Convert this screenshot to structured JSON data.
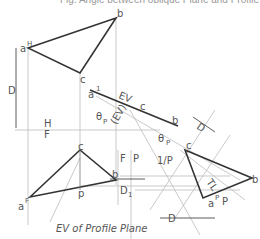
{
  "caption": "Fig. Angle between oblique Plane and Profile",
  "labels": {
    "aH": "a",
    "aH_sup": "H",
    "b_top": "b",
    "c_top": "c",
    "D_left": "D",
    "H": "H",
    "F": "F",
    "c_front": "c",
    "b_front": "b",
    "aF": "a",
    "aF_sup": "F",
    "p": "p",
    "FP_F": "F",
    "FP_P": "P",
    "D1": "D",
    "D1_sub": "1",
    "a1": "a",
    "a1_sup": "1",
    "EV": "EV",
    "c_aux": "c",
    "b_aux": "b",
    "EV_paren": "(EV)",
    "theta1": "θ",
    "theta1_sub": "P",
    "theta2": "θ",
    "theta2_sub": "P",
    "D_aux": "D",
    "oneP": "1/P",
    "c_p": "c",
    "b_p": "b",
    "aP": "a",
    "aP_sup": "P",
    "P": "P",
    "TL": "TL",
    "D_bottom": "D",
    "ev_profile": "EV of Profile Plane"
  },
  "colors": {
    "line": "#333",
    "light": "#aaa",
    "text": "#555"
  }
}
